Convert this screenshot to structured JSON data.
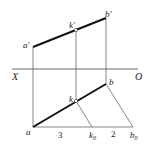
{
  "diagram": {
    "type": "orthographic-projection",
    "axis": {
      "left_label": "X",
      "right_label": "O"
    },
    "points": {
      "a_prime": {
        "label": "a′",
        "x": 33,
        "y": 47
      },
      "k_prime": {
        "label": "k′",
        "x": 76,
        "y": 30
      },
      "b_prime": {
        "label": "b′",
        "x": 106,
        "y": 18
      },
      "a": {
        "label": "a",
        "x": 33,
        "y": 127
      },
      "k": {
        "label": "k",
        "x": 76,
        "y": 101
      },
      "b": {
        "label": "b",
        "x": 106,
        "y": 84
      },
      "k0": {
        "label": "k",
        "sub": "0",
        "x": 92,
        "y": 127
      },
      "b0": {
        "label": "b",
        "sub": "0",
        "x": 133,
        "y": 127
      }
    },
    "ratio_labels": {
      "first": "3",
      "second": "2"
    },
    "colors": {
      "line": "#333333",
      "thick_line": "#111111",
      "background": "#ffffff"
    }
  }
}
